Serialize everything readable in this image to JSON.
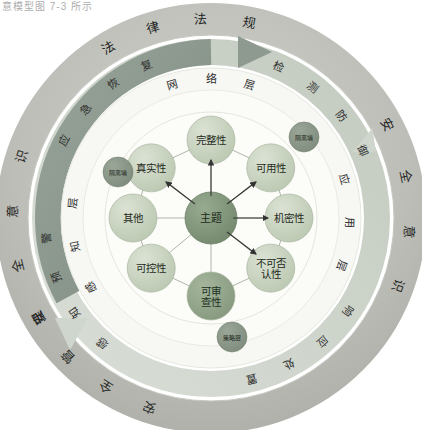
{
  "figure": {
    "caption_fragment": "意模型图 7-3 所示",
    "background": "#ffffff"
  },
  "colors": {
    "outer_ring": "#b9bbb4",
    "outer_ring_light": "#c9cbc4",
    "arrow_ring_dark": "#8e9a90",
    "arrow_ring_light": "#cfd6cd",
    "mid_ring": "#f4f5f0",
    "inner_disc": "#fbfbf7",
    "node_light": "#c9d3c0",
    "node_mid": "#bcc9b2",
    "node_dark": "#8fa287",
    "center_node": "#7e9278",
    "badge": "#8d9a8b",
    "line": "#9aa396",
    "text": "#2b2b2b"
  },
  "outer_ring": {
    "name": "outer-governance-ring",
    "labels": [
      {
        "text": "法律法规",
        "position": "top"
      },
      {
        "text": "安全意识",
        "position": "right"
      },
      {
        "text": "安全管理",
        "position": "bottom"
      },
      {
        "text": "安全意识",
        "position": "left"
      }
    ],
    "characters_top": [
      "法",
      "律",
      "法",
      "规"
    ],
    "characters_right": [
      "安",
      "全",
      "意",
      "识"
    ],
    "characters_bottom": [
      "安",
      "全",
      "管",
      "理"
    ],
    "characters_left": [
      "安",
      "全",
      "意",
      "识"
    ]
  },
  "arrow_ring": {
    "name": "cycle-arrow-ring",
    "labels": [
      {
        "text": "应急恢复",
        "position": "upper-left"
      },
      {
        "text": "检测防御",
        "position": "upper-right"
      },
      {
        "text": "感知预警",
        "position": "lower-left"
      },
      {
        "text": "响应处置",
        "position": "lower-right"
      }
    ],
    "chars_upper_left": [
      "应",
      "急",
      "恢",
      "复"
    ],
    "chars_upper_right": [
      "检",
      "测",
      "防",
      "御"
    ],
    "chars_lower_left": [
      "感",
      "知",
      "预",
      "警"
    ],
    "chars_lower_right": [
      "响",
      "应",
      "处",
      "置"
    ]
  },
  "layer_ring": {
    "name": "layer-ring",
    "layers": [
      {
        "text": "网络层",
        "position": "top",
        "chars": [
          "网",
          "络",
          "层"
        ]
      },
      {
        "text": "应用层",
        "position": "right",
        "chars": [
          "应",
          "用",
          "层"
        ]
      },
      {
        "text": "感知层",
        "position": "left",
        "chars": [
          "感",
          "知",
          "层"
        ]
      }
    ]
  },
  "center": {
    "name": "center-node",
    "label": "主题"
  },
  "attributes": [
    {
      "id": "integrity",
      "label": "完整性",
      "tone": "light",
      "angle": -90,
      "lines": [
        "完整性"
      ]
    },
    {
      "id": "authenticity",
      "label": "真实性",
      "tone": "light",
      "angle": -140,
      "lines": [
        "真实性"
      ]
    },
    {
      "id": "availability",
      "label": "可用性",
      "tone": "light",
      "angle": -40,
      "lines": [
        "可用性"
      ]
    },
    {
      "id": "other",
      "label": "其他",
      "tone": "light",
      "angle": 180,
      "lines": [
        "其他"
      ]
    },
    {
      "id": "confidentiality",
      "label": "机密性",
      "tone": "light",
      "angle": 0,
      "lines": [
        "机密性"
      ]
    },
    {
      "id": "controllability",
      "label": "可控性",
      "tone": "light",
      "angle": 140,
      "lines": [
        "可控性"
      ]
    },
    {
      "id": "nonrepudiation",
      "label": "不可否认性",
      "tone": "light",
      "angle": 40,
      "lines": [
        "不可否",
        "认性"
      ]
    },
    {
      "id": "auditability",
      "label": "可审查性",
      "tone": "dark",
      "angle": 90,
      "lines": [
        "可审",
        "查性"
      ]
    }
  ],
  "badges": [
    {
      "id": "badge-left",
      "label": "隔离墙",
      "position": "left"
    },
    {
      "id": "badge-right",
      "label": "隔离墙",
      "position": "upper-right"
    },
    {
      "id": "badge-bottom",
      "label": "策略层",
      "position": "bottom"
    }
  ],
  "arrows": {
    "name": "relation-arrows",
    "targets": [
      "完整性",
      "真实性",
      "可用性",
      "机密性",
      "不可否认性"
    ]
  }
}
